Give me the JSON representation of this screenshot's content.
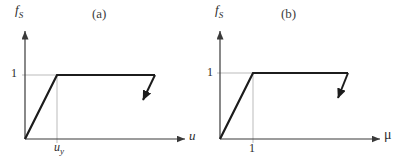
{
  "figure": {
    "background": "#ffffff",
    "ink": "#1c1c1c",
    "axis_color": "#3a3a3a",
    "grid_color": "#a9a9a9",
    "panels": [
      {
        "id": "a",
        "tag": "(a)",
        "ylabel": {
          "base": "f",
          "accent": "˜",
          "sub": "S"
        },
        "ytick": "1",
        "xtick": {
          "base": "u",
          "sub": "y"
        },
        "xlabel": "u",
        "geometry": {
          "origin": [
            25,
            139
          ],
          "yaxis_top": [
            25,
            31
          ],
          "xaxis_end": [
            185,
            139
          ],
          "yield": [
            57,
            75
          ],
          "plateau_end": [
            155,
            75
          ],
          "unload_tip": [
            143,
            100
          ]
        }
      },
      {
        "id": "b",
        "tag": "(b)",
        "ylabel": {
          "base": "f",
          "accent": "˜",
          "sub": "S"
        },
        "ytick": "1",
        "xtick": {
          "base": "1",
          "sub": ""
        },
        "xlabel": "μ",
        "geometry": {
          "origin": [
            16,
            139
          ],
          "yaxis_top": [
            16,
            31
          ],
          "xaxis_end": [
            176,
            139
          ],
          "yield": [
            49,
            73
          ],
          "plateau_end": [
            144,
            73
          ],
          "unload_tip": [
            134,
            98
          ]
        }
      }
    ]
  },
  "chart_data": [
    {
      "type": "line",
      "title": "(a)",
      "xlabel": "u",
      "ylabel": "f̃S",
      "xlim": [
        0,
        5
      ],
      "ylim": [
        0,
        1.7
      ],
      "grid": false,
      "xticks": [
        {
          "value": 1,
          "label": "u_y"
        }
      ],
      "yticks": [
        {
          "value": 1,
          "label": "1"
        }
      ],
      "series": [
        {
          "name": "elastic-loading",
          "points": [
            [
              0,
              0
            ],
            [
              1,
              1
            ]
          ]
        },
        {
          "name": "plastic-plateau",
          "points": [
            [
              1,
              1
            ],
            [
              4.1,
              1
            ]
          ]
        },
        {
          "name": "unloading",
          "points": [
            [
              4.1,
              1
            ],
            [
              3.7,
              0.62
            ]
          ],
          "arrow_at_end": true
        }
      ],
      "note": "x measured in units of yield displacement u_y"
    },
    {
      "type": "line",
      "title": "(b)",
      "xlabel": "μ",
      "ylabel": "f̃S",
      "xlim": [
        0,
        5
      ],
      "ylim": [
        0,
        1.7
      ],
      "grid": false,
      "xticks": [
        {
          "value": 1,
          "label": "1"
        }
      ],
      "yticks": [
        {
          "value": 1,
          "label": "1"
        }
      ],
      "series": [
        {
          "name": "elastic-loading",
          "points": [
            [
              0,
              0
            ],
            [
              1,
              1
            ]
          ]
        },
        {
          "name": "plastic-plateau",
          "points": [
            [
              1,
              1
            ],
            [
              3.9,
              1
            ]
          ]
        },
        {
          "name": "unloading",
          "points": [
            [
              3.9,
              1
            ],
            [
              3.6,
              0.63
            ]
          ],
          "arrow_at_end": true
        }
      ],
      "note": "ductility form of panel (a); yield at μ = 1"
    }
  ]
}
